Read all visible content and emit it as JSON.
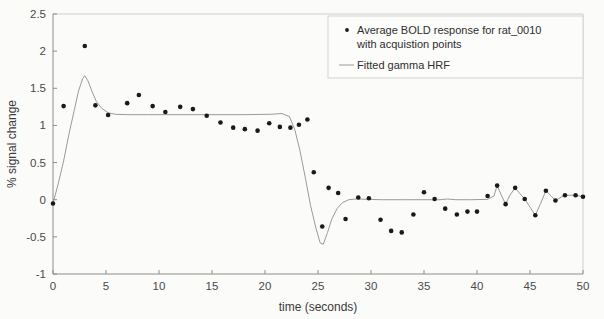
{
  "chart_data": {
    "type": "scatter",
    "title": "",
    "xlabel": "time (seconds)",
    "ylabel": "% signal change",
    "xlim": [
      0,
      50
    ],
    "ylim": [
      -1,
      2.5
    ],
    "xticks": [
      0,
      5,
      10,
      15,
      20,
      25,
      30,
      35,
      40,
      45,
      50
    ],
    "yticks": [
      -1,
      -0.5,
      0,
      0.5,
      1,
      1.5,
      2,
      2.5
    ],
    "xtick_labels": [
      "0",
      "5",
      "10",
      "15",
      "20",
      "25",
      "30",
      "35",
      "40",
      "45",
      "50"
    ],
    "ytick_labels": [
      "-1",
      "-0.5",
      "0",
      "0.5",
      "1",
      "1.5",
      "2",
      "2.5"
    ],
    "grid": false,
    "legend_position": "top-right",
    "series": [
      {
        "name": "Average BOLD response for rat_0010 with acquistion points",
        "type": "scatter",
        "marker": "dot",
        "color": "#1a1a1a",
        "points": [
          [
            0.0,
            -0.05
          ],
          [
            1.0,
            1.26
          ],
          [
            3.0,
            2.07
          ],
          [
            4.0,
            1.27
          ],
          [
            5.2,
            1.14
          ],
          [
            7.0,
            1.3
          ],
          [
            8.1,
            1.41
          ],
          [
            9.4,
            1.26
          ],
          [
            10.6,
            1.18
          ],
          [
            12.0,
            1.25
          ],
          [
            13.2,
            1.22
          ],
          [
            14.5,
            1.13
          ],
          [
            15.8,
            1.04
          ],
          [
            17.0,
            0.97
          ],
          [
            18.1,
            0.95
          ],
          [
            19.3,
            0.93
          ],
          [
            20.4,
            1.03
          ],
          [
            21.4,
            0.98
          ],
          [
            22.4,
            0.97
          ],
          [
            23.2,
            1.01
          ],
          [
            24.0,
            1.08
          ],
          [
            24.6,
            0.37
          ],
          [
            25.4,
            -0.36
          ],
          [
            26.0,
            0.16
          ],
          [
            26.9,
            0.09
          ],
          [
            27.6,
            -0.26
          ],
          [
            28.8,
            0.03
          ],
          [
            29.8,
            0.02
          ],
          [
            30.9,
            -0.27
          ],
          [
            31.9,
            -0.42
          ],
          [
            32.9,
            -0.44
          ],
          [
            34.0,
            -0.2
          ],
          [
            35.0,
            0.1
          ],
          [
            36.0,
            0.01
          ],
          [
            37.0,
            -0.12
          ],
          [
            38.1,
            -0.2
          ],
          [
            39.1,
            -0.16
          ],
          [
            40.0,
            -0.16
          ],
          [
            41.0,
            0.05
          ],
          [
            41.9,
            0.19
          ],
          [
            42.7,
            -0.06
          ],
          [
            43.6,
            0.16
          ],
          [
            44.5,
            0.01
          ],
          [
            45.5,
            -0.21
          ],
          [
            46.5,
            0.12
          ],
          [
            47.4,
            -0.01
          ],
          [
            48.3,
            0.06
          ],
          [
            49.3,
            0.06
          ],
          [
            50.0,
            0.04
          ]
        ]
      },
      {
        "name": "Fitted gamma HRF",
        "type": "line",
        "color": "#8f8f8f",
        "points": [
          [
            0.0,
            -0.05
          ],
          [
            0.5,
            0.22
          ],
          [
            1.0,
            0.52
          ],
          [
            1.5,
            0.88
          ],
          [
            2.0,
            1.2
          ],
          [
            2.4,
            1.46
          ],
          [
            2.8,
            1.63
          ],
          [
            3.0,
            1.67
          ],
          [
            3.3,
            1.6
          ],
          [
            3.7,
            1.45
          ],
          [
            4.1,
            1.32
          ],
          [
            4.6,
            1.23
          ],
          [
            5.2,
            1.17
          ],
          [
            5.9,
            1.15
          ],
          [
            7.0,
            1.145
          ],
          [
            9.0,
            1.145
          ],
          [
            12.0,
            1.145
          ],
          [
            15.0,
            1.145
          ],
          [
            18.0,
            1.145
          ],
          [
            20.5,
            1.15
          ],
          [
            21.6,
            1.16
          ],
          [
            22.3,
            1.12
          ],
          [
            22.8,
            0.95
          ],
          [
            23.3,
            0.66
          ],
          [
            23.8,
            0.3
          ],
          [
            24.3,
            -0.08
          ],
          [
            24.8,
            -0.38
          ],
          [
            25.2,
            -0.58
          ],
          [
            25.5,
            -0.6
          ],
          [
            25.9,
            -0.44
          ],
          [
            26.3,
            -0.26
          ],
          [
            26.8,
            -0.12
          ],
          [
            27.3,
            -0.04
          ],
          [
            27.9,
            0.0
          ],
          [
            28.6,
            0.01
          ],
          [
            29.6,
            0.005
          ],
          [
            31.0,
            0.0
          ],
          [
            33.0,
            0.0
          ],
          [
            35.0,
            0.0
          ],
          [
            36.5,
            0.0
          ],
          [
            37.2,
            0.01
          ],
          [
            38.0,
            0.0
          ],
          [
            39.5,
            0.0
          ],
          [
            41.0,
            0.005
          ],
          [
            41.6,
            0.05
          ],
          [
            41.9,
            0.19
          ],
          [
            42.3,
            0.06
          ],
          [
            42.7,
            -0.06
          ],
          [
            43.1,
            0.06
          ],
          [
            43.6,
            0.16
          ],
          [
            44.0,
            0.09
          ],
          [
            44.5,
            0.01
          ],
          [
            45.0,
            -0.1
          ],
          [
            45.5,
            -0.21
          ],
          [
            46.0,
            -0.05
          ],
          [
            46.5,
            0.12
          ],
          [
            47.0,
            0.05
          ],
          [
            47.4,
            -0.01
          ],
          [
            48.0,
            0.04
          ],
          [
            48.3,
            0.06
          ],
          [
            49.3,
            0.06
          ],
          [
            50.0,
            0.04
          ]
        ]
      }
    ]
  },
  "legend": {
    "entries": [
      {
        "marker": "dot",
        "line1": "Average BOLD response for rat_0010",
        "line2": "with acquistion points"
      },
      {
        "marker": "line",
        "line1": "Fitted gamma HRF",
        "line2": ""
      }
    ]
  }
}
